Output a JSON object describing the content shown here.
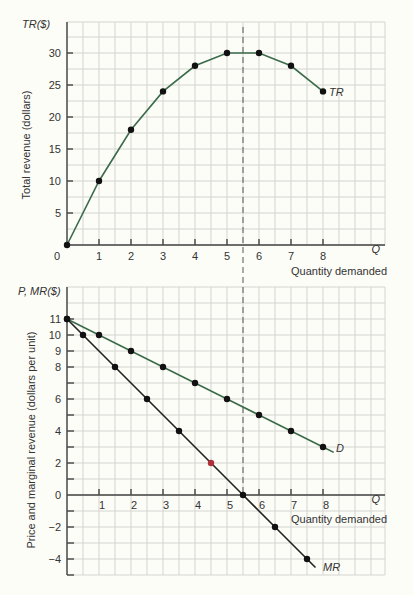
{
  "chart_data": [
    {
      "type": "line",
      "title": "",
      "ylabel_short": "TR($)",
      "ylabel": "Total revenue (dollars)",
      "xlabel_short": "Q",
      "xlabel": "Quantity demanded",
      "x_ticks": [
        0,
        1,
        2,
        3,
        4,
        5,
        6,
        7,
        8
      ],
      "y_ticks": [
        5,
        10,
        15,
        20,
        25,
        30
      ],
      "xlim": [
        0,
        9.5
      ],
      "ylim": [
        0,
        35
      ],
      "grid": true,
      "series": [
        {
          "name": "TR",
          "color": "#3a6b4a",
          "x": [
            0,
            1,
            2,
            3,
            4,
            5,
            6,
            7,
            8
          ],
          "y": [
            0,
            10,
            18,
            24,
            28,
            30,
            30,
            28,
            24
          ]
        }
      ],
      "annotations": [
        {
          "type": "vertical-dashed-line",
          "x": 5.5
        }
      ]
    },
    {
      "type": "line",
      "title": "",
      "ylabel_short": "P, MR($)",
      "ylabel": "Price and marginal revenue (dollars per unit)",
      "xlabel_short": "Q",
      "xlabel": "Quantity demanded",
      "x_ticks": [
        1,
        2,
        3,
        4,
        5,
        6,
        7,
        8
      ],
      "y_ticks": [
        -4,
        -2,
        0,
        2,
        4,
        6,
        8,
        9,
        10,
        11
      ],
      "xlim": [
        0,
        9.5
      ],
      "ylim": [
        -5,
        13
      ],
      "grid": true,
      "series": [
        {
          "name": "D",
          "color": "#3a6b4a",
          "x": [
            0,
            1,
            2,
            3,
            4,
            5,
            6,
            7,
            8
          ],
          "y": [
            11,
            10,
            9,
            8,
            7,
            6,
            5,
            4,
            3
          ]
        },
        {
          "name": "MR",
          "color": "#222222",
          "x": [
            0,
            0.5,
            1.5,
            2.5,
            3.5,
            4.5,
            5.5,
            6.5,
            7.5
          ],
          "y": [
            11,
            10,
            8,
            6,
            4,
            2,
            0,
            -2,
            -4
          ]
        }
      ],
      "annotations": [
        {
          "type": "vertical-dashed-line",
          "x": 5.5
        }
      ]
    }
  ],
  "top": {
    "y_short_label": "TR($)",
    "y_title": "Total revenue (dollars)",
    "x_short_label": "Q",
    "x_title": "Quantity demanded",
    "curve_label": "TR",
    "origin_label": "0"
  },
  "bottom": {
    "y_short_label": "P, MR($)",
    "y_title": "Price and marginal revenue (dollars per unit)",
    "x_short_label": "Q",
    "x_title": "Quantity demanded",
    "demand_label": "D",
    "mr_label": "MR"
  }
}
